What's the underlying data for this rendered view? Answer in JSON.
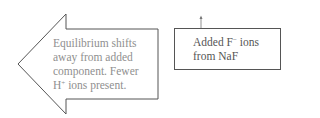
{
  "diagram": {
    "left_arrow": {
      "direction": "left",
      "lines": [
        "Equilibrium shifts",
        "away from added",
        "component. Fewer"
      ],
      "last_line": {
        "prefix": "H",
        "superscript": "+",
        "suffix": " ions present."
      }
    },
    "right_box": {
      "line1": {
        "prefix": "Added F",
        "superscript": "−",
        "suffix": " ions"
      },
      "line2": "from NaF"
    },
    "small_arrow": {
      "direction": "up"
    },
    "colors": {
      "stroke": "#555555",
      "arrow_text": "#8f8f8f",
      "box_text": "#555555"
    }
  }
}
